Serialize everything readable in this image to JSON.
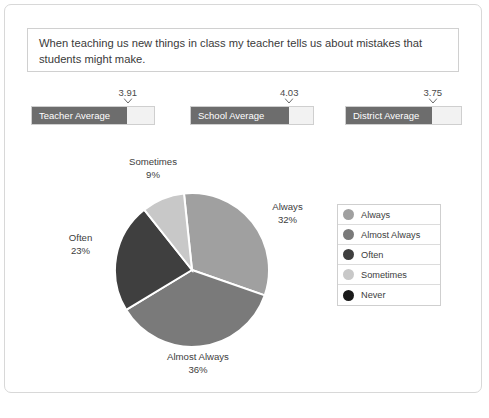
{
  "question": {
    "text": "When teaching us new things in class my teacher tells us about mistakes that students might make."
  },
  "gauges": {
    "scale_max": 5,
    "items": [
      {
        "label": "Teacher Average",
        "value": "3.91",
        "fill_percent": 78
      },
      {
        "label": "School Average",
        "value": "4.03",
        "fill_percent": 80
      },
      {
        "label": "District Average",
        "value": "3.75",
        "fill_percent": 75
      }
    ]
  },
  "legend": {
    "items": [
      {
        "label": "Always",
        "color": "#a0a0a0"
      },
      {
        "label": "Almost Always",
        "color": "#7a7a7a"
      },
      {
        "label": "Often",
        "color": "#3f3f3f"
      },
      {
        "label": "Sometimes",
        "color": "#c8c8c8"
      },
      {
        "label": "Never",
        "color": "#1a1a1a"
      }
    ]
  },
  "callouts": {
    "sometimes": {
      "label": "Sometimes",
      "percent": "9%"
    },
    "always": {
      "label": "Always",
      "percent": "32%"
    },
    "often": {
      "label": "Often",
      "percent": "23%"
    },
    "almost": {
      "label": "Almost Always",
      "percent": "36%"
    }
  },
  "chart_data": {
    "type": "pie",
    "title": "When teaching us new things in class my teacher tells us about mistakes that students might make.",
    "categories": [
      "Always",
      "Almost Always",
      "Often",
      "Sometimes",
      "Never"
    ],
    "values": [
      32,
      36,
      23,
      9,
      0
    ],
    "value_labels": [
      "32%",
      "36%",
      "23%",
      "9%",
      ""
    ],
    "colors": [
      "#a0a0a0",
      "#7a7a7a",
      "#3f3f3f",
      "#c8c8c8",
      "#1a1a1a"
    ],
    "units": "percent",
    "legend_position": "right",
    "start_angle_deg": -6,
    "averages": {
      "Teacher Average": 3.91,
      "School Average": 4.03,
      "District Average": 3.75,
      "scale_max": 5
    }
  }
}
